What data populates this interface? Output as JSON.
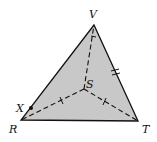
{
  "figure": {
    "type": "geometry-diagram",
    "colors": {
      "fill": "#c8c8c8",
      "stroke": "#111111",
      "background": "#ffffff"
    },
    "points": {
      "V": {
        "label": "V",
        "x": 94,
        "y": 25
      },
      "R": {
        "label": "R",
        "x": 21,
        "y": 120
      },
      "T": {
        "label": "T",
        "x": 138,
        "y": 121
      },
      "S": {
        "label": "S",
        "x": 84,
        "y": 89
      },
      "X": {
        "label": "X",
        "x": 31,
        "y": 108
      }
    },
    "segments": [
      {
        "from": "R",
        "to": "V",
        "style": "solid"
      },
      {
        "from": "V",
        "to": "T",
        "style": "solid",
        "ticks": 2
      },
      {
        "from": "R",
        "to": "T",
        "style": "solid"
      },
      {
        "from": "S",
        "to": "V",
        "style": "dashed",
        "ticks": 1
      },
      {
        "from": "S",
        "to": "R",
        "style": "dashed",
        "ticks": 1
      },
      {
        "from": "S",
        "to": "T",
        "style": "dashed",
        "ticks": 1
      }
    ],
    "labels": {
      "V": "V",
      "R": "R",
      "T": "T",
      "S": "S",
      "X": "X"
    }
  }
}
